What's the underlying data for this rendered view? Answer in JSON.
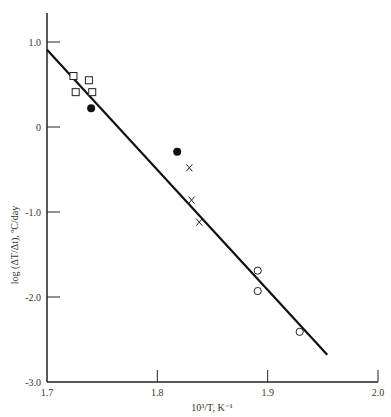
{
  "chart_data": {
    "type": "scatter",
    "title": "",
    "xlabel": "10³/T, K⁻¹",
    "ylabel": "log (ΔT/Δt), ºC/day",
    "xlim": [
      1.7,
      2.0
    ],
    "ylim": [
      -3.0,
      1.3
    ],
    "x_ticks": [
      1.7,
      1.8,
      1.9,
      2.0
    ],
    "x_tick_labels": [
      "1.7",
      "1.8",
      "1.9",
      "2.0"
    ],
    "y_ticks": [
      1.0,
      0,
      -1.0,
      -2.0,
      -3.0
    ],
    "y_tick_labels": [
      "1.0",
      "0",
      "-1.0",
      "-2.0",
      "-3.0"
    ],
    "grid": false,
    "legend": null,
    "series": [
      {
        "name": "open squares",
        "marker": "square-open",
        "points": [
          {
            "x": 1.724,
            "y": 0.6
          },
          {
            "x": 1.738,
            "y": 0.55
          },
          {
            "x": 1.726,
            "y": 0.41
          },
          {
            "x": 1.741,
            "y": 0.41
          }
        ]
      },
      {
        "name": "filled circles",
        "marker": "circle-filled",
        "points": [
          {
            "x": 1.74,
            "y": 0.22
          },
          {
            "x": 1.818,
            "y": -0.29
          }
        ]
      },
      {
        "name": "crosses",
        "marker": "x",
        "points": [
          {
            "x": 1.829,
            "y": -0.48
          },
          {
            "x": 1.831,
            "y": -0.86
          },
          {
            "x": 1.838,
            "y": -1.12
          }
        ]
      },
      {
        "name": "open circles",
        "marker": "circle-open",
        "points": [
          {
            "x": 1.891,
            "y": -1.69
          },
          {
            "x": 1.891,
            "y": -1.93
          },
          {
            "x": 1.929,
            "y": -2.41
          }
        ]
      }
    ],
    "fit_line": {
      "name": "linear fit",
      "start": {
        "x": 1.7,
        "y": 0.91
      },
      "end": {
        "x": 1.954,
        "y": -2.68
      }
    }
  }
}
